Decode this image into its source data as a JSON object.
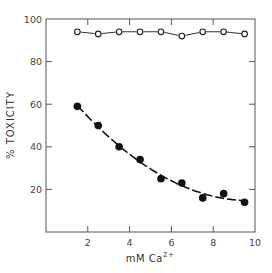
{
  "chart_data": {
    "type": "scatter",
    "title": "",
    "xlabel": "mM Ca2+",
    "xlabel_parts": {
      "base": "mM  Ca",
      "sup": "2+"
    },
    "ylabel": "% TOXICITY",
    "xlim": [
      0,
      10
    ],
    "ylim": [
      0,
      100
    ],
    "xticks": [
      2,
      4,
      6,
      8,
      10
    ],
    "yticks": [
      20,
      40,
      60,
      80,
      100
    ],
    "grid": false,
    "legend": "none",
    "series": [
      {
        "name": "open circles",
        "marker": "open-circle",
        "line": "solid connecting segments",
        "x": [
          1.5,
          2.5,
          3.5,
          4.5,
          5.5,
          6.5,
          7.5,
          8.5,
          9.5
        ],
        "values": [
          94,
          93,
          94,
          94,
          94,
          92,
          94,
          94,
          93
        ]
      },
      {
        "name": "filled circles",
        "marker": "filled-circle",
        "line": "dashed fitted curve",
        "x": [
          1.5,
          2.5,
          3.5,
          4.5,
          5.5,
          6.5,
          7.5,
          8.5,
          9.5
        ],
        "values": [
          59,
          50,
          40,
          34,
          25,
          23,
          16,
          18,
          14
        ]
      }
    ]
  }
}
